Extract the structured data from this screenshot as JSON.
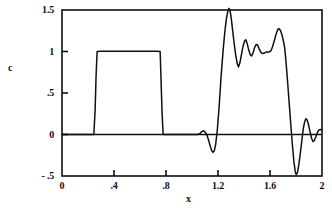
{
  "chart_data": {
    "type": "line",
    "title": "",
    "subtitle": "",
    "xlabel": "x",
    "ylabel": "c",
    "xlim": [
      0,
      2
    ],
    "ylim": [
      -0.5,
      1.5
    ],
    "grid": false,
    "legend": null,
    "x_ticks": [
      {
        "value": 0,
        "label": "0"
      },
      {
        "value": 0.4,
        "label": ".4"
      },
      {
        "value": 0.8,
        "label": ".8"
      },
      {
        "value": 1.2,
        "label": "1.2"
      },
      {
        "value": 1.6,
        "label": "1.6"
      },
      {
        "value": 2.0,
        "label": "2"
      }
    ],
    "y_ticks": [
      {
        "value": 1.5,
        "label": "1.5"
      },
      {
        "value": 1.0,
        "label": "1"
      },
      {
        "value": 0.5,
        "label": ".5"
      },
      {
        "value": 0.0,
        "label": "0"
      },
      {
        "value": -0.5,
        "label": "- .5"
      }
    ],
    "zero_line": {
      "value": 0,
      "visible": true,
      "color": "#101010"
    },
    "line_color": "#101010",
    "frame_color": "#101010",
    "background": "#ffffff",
    "series": [
      {
        "name": "c",
        "color": "#101010",
        "points": [
          [
            0.0,
            0.0
          ],
          [
            0.05,
            0.0
          ],
          [
            0.1,
            0.0
          ],
          [
            0.15,
            0.0
          ],
          [
            0.2,
            0.0
          ],
          [
            0.23,
            0.0
          ],
          [
            0.245,
            0.0
          ],
          [
            0.255,
            0.3
          ],
          [
            0.262,
            0.7
          ],
          [
            0.27,
            1.0
          ],
          [
            0.3,
            1.002
          ],
          [
            0.35,
            1.003
          ],
          [
            0.4,
            1.003
          ],
          [
            0.45,
            1.003
          ],
          [
            0.5,
            1.003
          ],
          [
            0.55,
            1.003
          ],
          [
            0.6,
            1.003
          ],
          [
            0.65,
            1.003
          ],
          [
            0.7,
            1.003
          ],
          [
            0.73,
            1.003
          ],
          [
            0.755,
            1.0
          ],
          [
            0.762,
            0.65
          ],
          [
            0.77,
            0.25
          ],
          [
            0.778,
            0.0
          ],
          [
            0.8,
            0.0
          ],
          [
            0.85,
            0.0
          ],
          [
            0.9,
            0.0
          ],
          [
            0.95,
            0.0
          ],
          [
            1.0,
            0.0
          ],
          [
            1.04,
            0.0
          ],
          [
            1.06,
            0.01
          ],
          [
            1.075,
            0.035
          ],
          [
            1.09,
            0.045
          ],
          [
            1.1,
            0.03
          ],
          [
            1.112,
            0.005
          ],
          [
            1.125,
            -0.055
          ],
          [
            1.14,
            -0.14
          ],
          [
            1.152,
            -0.195
          ],
          [
            1.162,
            -0.215
          ],
          [
            1.172,
            -0.195
          ],
          [
            1.182,
            -0.12
          ],
          [
            1.195,
            0.06
          ],
          [
            1.208,
            0.32
          ],
          [
            1.222,
            0.66
          ],
          [
            1.238,
            0.99
          ],
          [
            1.252,
            1.23
          ],
          [
            1.264,
            1.39
          ],
          [
            1.275,
            1.48
          ],
          [
            1.285,
            1.52
          ],
          [
            1.293,
            1.49
          ],
          [
            1.302,
            1.4
          ],
          [
            1.312,
            1.26
          ],
          [
            1.324,
            1.1
          ],
          [
            1.336,
            0.96
          ],
          [
            1.348,
            0.855
          ],
          [
            1.358,
            0.815
          ],
          [
            1.368,
            0.86
          ],
          [
            1.38,
            0.96
          ],
          [
            1.392,
            1.06
          ],
          [
            1.404,
            1.125
          ],
          [
            1.414,
            1.14
          ],
          [
            1.424,
            1.1
          ],
          [
            1.436,
            1.02
          ],
          [
            1.448,
            0.96
          ],
          [
            1.458,
            0.945
          ],
          [
            1.47,
            0.985
          ],
          [
            1.482,
            1.05
          ],
          [
            1.494,
            1.085
          ],
          [
            1.504,
            1.08
          ],
          [
            1.516,
            1.035
          ],
          [
            1.528,
            0.995
          ],
          [
            1.54,
            0.975
          ],
          [
            1.552,
            0.978
          ],
          [
            1.566,
            0.99
          ],
          [
            1.58,
            0.995
          ],
          [
            1.594,
            0.995
          ],
          [
            1.608,
            1.01
          ],
          [
            1.62,
            1.06
          ],
          [
            1.634,
            1.135
          ],
          [
            1.648,
            1.215
          ],
          [
            1.66,
            1.265
          ],
          [
            1.67,
            1.275
          ],
          [
            1.682,
            1.25
          ],
          [
            1.694,
            1.19
          ],
          [
            1.706,
            1.105
          ],
          [
            1.714,
            1.03
          ],
          [
            1.724,
            0.86
          ],
          [
            1.736,
            0.62
          ],
          [
            1.748,
            0.37
          ],
          [
            1.76,
            0.12
          ],
          [
            1.772,
            -0.12
          ],
          [
            1.784,
            -0.33
          ],
          [
            1.794,
            -0.445
          ],
          [
            1.802,
            -0.485
          ],
          [
            1.812,
            -0.455
          ],
          [
            1.822,
            -0.36
          ],
          [
            1.834,
            -0.215
          ],
          [
            1.846,
            -0.06
          ],
          [
            1.856,
            0.07
          ],
          [
            1.866,
            0.15
          ],
          [
            1.876,
            0.19
          ],
          [
            1.886,
            0.175
          ],
          [
            1.896,
            0.12
          ],
          [
            1.908,
            0.035
          ],
          [
            1.92,
            -0.045
          ],
          [
            1.93,
            -0.085
          ],
          [
            1.94,
            -0.075
          ],
          [
            1.952,
            -0.03
          ],
          [
            1.964,
            0.02
          ],
          [
            1.976,
            0.055
          ],
          [
            1.988,
            0.06
          ],
          [
            2.0,
            0.055
          ]
        ]
      }
    ]
  },
  "axis": {
    "y_label": "c",
    "x_label": "x"
  }
}
